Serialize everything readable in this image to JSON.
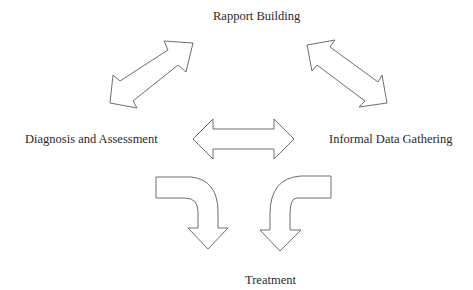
{
  "diagram": {
    "nodes": [
      {
        "id": "rapport",
        "label": "Rapport Building"
      },
      {
        "id": "diagnosis",
        "label": "Diagnosis and Assessment"
      },
      {
        "id": "informal",
        "label": "Informal Data Gathering"
      },
      {
        "id": "treatment",
        "label": "Treatment"
      }
    ],
    "edges": [
      {
        "from": "diagnosis",
        "to": "rapport",
        "type": "bidirectional-block-arrow"
      },
      {
        "from": "rapport",
        "to": "informal",
        "type": "bidirectional-block-arrow"
      },
      {
        "from": "diagnosis",
        "to": "informal",
        "type": "bidirectional-block-arrow"
      },
      {
        "from": "diagnosis",
        "to": "treatment",
        "type": "curved-block-arrow"
      },
      {
        "from": "informal",
        "to": "treatment",
        "type": "curved-block-arrow"
      }
    ],
    "colors": {
      "background": "#ffffff",
      "arrow_fill": "#ffffff",
      "arrow_stroke": "#6e6e6e",
      "text": "#2a2a2a"
    }
  }
}
